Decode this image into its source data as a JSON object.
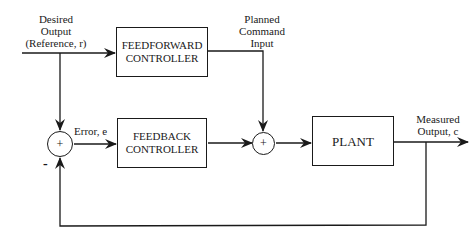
{
  "diagram": {
    "type": "block-diagram",
    "title": "",
    "blocks": {
      "feedforward": {
        "line1": "FEEDFORWARD",
        "line2": "CONTROLLER"
      },
      "feedback": {
        "line1": "FEEDBACK",
        "line2": "CONTROLLER"
      },
      "plant": {
        "label": "PLANT"
      }
    },
    "summing_junctions": {
      "error_sum": {
        "symbol": "+",
        "minus_sign": "-"
      },
      "command_sum": {
        "symbol": "+"
      }
    },
    "signals": {
      "reference": {
        "line1": "Desired",
        "line2": "Output",
        "line3": "(Reference, r)"
      },
      "planned_command": {
        "line1": "Planned",
        "line2": "Command",
        "line3": "Input"
      },
      "error": {
        "label": "Error, e"
      },
      "measured_output": {
        "line1": "Measured",
        "line2": "Output, c"
      }
    },
    "colors": {
      "stroke": "#1a1a1a",
      "background": "#ffffff"
    }
  }
}
